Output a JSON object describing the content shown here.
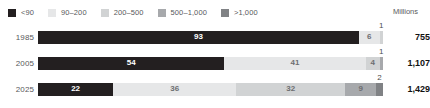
{
  "legend": {
    "units_label": "Millions",
    "items": [
      {
        "label": "<90",
        "color": "#231f20"
      },
      {
        "label": "90–200",
        "color": "#e6e7e8"
      },
      {
        "label": "200–500",
        "color": "#d1d3d4"
      },
      {
        "label": "500–1,000",
        "color": "#a7a9ac"
      },
      {
        "label": ">1,000",
        "color": "#808285"
      }
    ]
  },
  "chart_data": {
    "type": "bar",
    "subtype": "stacked-horizontal-100pct",
    "title": "",
    "xlabel": "",
    "ylabel": "",
    "units": "Millions",
    "xlim": [
      0,
      100
    ],
    "grid": false,
    "legend_position": "top-left",
    "categories": [
      "1985",
      "2005",
      "2025"
    ],
    "series": [
      {
        "name": "<90",
        "color": "#231f20",
        "values": [
          93,
          54,
          22
        ]
      },
      {
        "name": "90–200",
        "color": "#e6e7e8",
        "values": [
          6,
          41,
          36
        ]
      },
      {
        "name": "200–500",
        "color": "#d1d3d4",
        "values": [
          1,
          4,
          32
        ]
      },
      {
        "name": "500–1,000",
        "color": "#a7a9ac",
        "values": [
          0,
          1,
          9
        ]
      },
      {
        "name": ">1,000",
        "color": "#808285",
        "values": [
          0,
          0,
          2
        ]
      }
    ],
    "totals": [
      "755",
      "1,107",
      "1,429"
    ]
  },
  "rows": [
    {
      "year": "1985",
      "total": "755",
      "segments": [
        {
          "value": "93",
          "pct": 93,
          "color": "#231f20",
          "text": "on-dark",
          "callout": false
        },
        {
          "value": "6",
          "pct": 6,
          "color": "#e6e7e8",
          "text": "on-light",
          "callout": false
        },
        {
          "value": "1",
          "pct": 1,
          "color": "#d1d3d4",
          "text": "on-light",
          "callout": true
        }
      ]
    },
    {
      "year": "2005",
      "total": "1,107",
      "segments": [
        {
          "value": "54",
          "pct": 54,
          "color": "#231f20",
          "text": "on-dark",
          "callout": false
        },
        {
          "value": "41",
          "pct": 41,
          "color": "#e6e7e8",
          "text": "on-light",
          "callout": false
        },
        {
          "value": "4",
          "pct": 4,
          "color": "#d1d3d4",
          "text": "on-light",
          "callout": false
        },
        {
          "value": "1",
          "pct": 1,
          "color": "#a7a9ac",
          "text": "on-light",
          "callout": true
        }
      ]
    },
    {
      "year": "2025",
      "total": "1,429",
      "segments": [
        {
          "value": "22",
          "pct": 22,
          "color": "#231f20",
          "text": "on-dark",
          "callout": false
        },
        {
          "value": "36",
          "pct": 36,
          "color": "#e6e7e8",
          "text": "on-light",
          "callout": false
        },
        {
          "value": "32",
          "pct": 32,
          "color": "#d1d3d4",
          "text": "on-light",
          "callout": false
        },
        {
          "value": "9",
          "pct": 9,
          "color": "#a7a9ac",
          "text": "on-light",
          "callout": false
        },
        {
          "value": "2",
          "pct": 2,
          "color": "#808285",
          "text": "on-light",
          "callout": true
        }
      ]
    }
  ]
}
